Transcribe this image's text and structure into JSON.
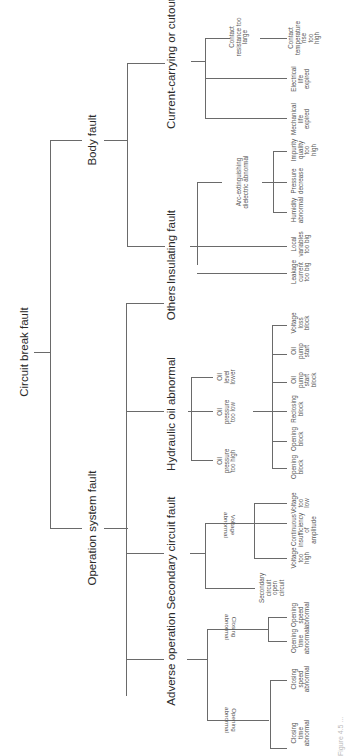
{
  "diagram": {
    "type": "fault-tree",
    "orientation": "rotated-90-ccw",
    "root": "Circuit break fault",
    "level1": [
      {
        "label": "Body fault",
        "children": [
          {
            "label": "Current-carrying or cutout fault",
            "children": [
              {
                "label": "Contact resistance too large",
                "children": [
                  {
                    "label": "Contact temperature rise too high"
                  }
                ]
              },
              {
                "label": "Electrical life expired"
              },
              {
                "label": "Mechanical life expired"
              }
            ]
          },
          {
            "label": "Insulating fault",
            "children": [
              {
                "label": "Arc-extinguishing dielectric abnormal",
                "children": [
                  {
                    "label": "Impurity quality too high"
                  },
                  {
                    "label": "Pressure decrease"
                  },
                  {
                    "label": "Humidity abnormal"
                  }
                ]
              },
              {
                "label": "Local variables too big"
              },
              {
                "label": "Leakage current too big"
              }
            ]
          }
        ]
      },
      {
        "label": "Operation system fault",
        "children": [
          {
            "label": "Others"
          },
          {
            "label": "Hydraulic oil abnormal",
            "children": [
              {
                "label": "Oil level lower"
              },
              {
                "label": "Oil pressure too low",
                "children": [
                  {
                    "label": "Voltage loss block"
                  },
                  {
                    "label": "Oil pump start"
                  },
                  {
                    "label": "Oil pump start block"
                  },
                  {
                    "label": "Reclosing block"
                  },
                  {
                    "label": "Opening block"
                  },
                  {
                    "label": "Opening block"
                  }
                ]
              },
              {
                "label": "Oil pressure too high"
              }
            ]
          },
          {
            "label": "Secondary circuit fault",
            "children": [
              {
                "label": "Voltage abnormal",
                "children": [
                  {
                    "label": "Voltage too low"
                  },
                  {
                    "label": "Continuous insufficiency of amplitude"
                  },
                  {
                    "label": "Voltage too high"
                  }
                ]
              },
              {
                "label": "Secondary circuit open circuit"
              }
            ]
          },
          {
            "label": "Adverse operation",
            "children": [
              {
                "label": "Closing abnormal",
                "children": [
                  {
                    "label": "Opening speed abnormal"
                  },
                  {
                    "label": "Opening time abnormal"
                  }
                ]
              },
              {
                "label": "Opening abnormal",
                "children": [
                  {
                    "label": "Closing speed abnormal"
                  },
                  {
                    "label": "Closing time abnormal"
                  }
                ]
              }
            ]
          }
        ]
      }
    ],
    "caption": "Figure 4.5 ..."
  },
  "labels": {
    "root": "Circuit break fault",
    "body": "Body fault",
    "operation": "Operation system fault",
    "current": "Current-carrying or cutout fault",
    "insulating": "Insulating fault",
    "others": "Others",
    "hydraulic": "Hydraulic oil abnormal",
    "secondary": "Secondary circuit fault",
    "adverse": "Adverse operation",
    "contact_res": [
      "Contact",
      "resistance too",
      "large"
    ],
    "contact_temp": [
      "Contact",
      "temperature",
      "rise",
      "too",
      "high"
    ],
    "elec_life": [
      "Electrical",
      "life",
      "expired"
    ],
    "mech_life": [
      "Mechanical",
      "life",
      "expired"
    ],
    "arc": [
      "Arc-extinguishing",
      "dielectric abnormal"
    ],
    "impurity": [
      "Impurity",
      "quality",
      "too",
      "high"
    ],
    "pressure_dec": [
      "Pressure",
      "decrease"
    ],
    "humidity": [
      "Humidity",
      "abnormal"
    ],
    "local_var": [
      "Local",
      "variables",
      "too big"
    ],
    "leakage": [
      "Leakage",
      "current",
      "too big"
    ],
    "voltage_loss": [
      "Voltage",
      "loss",
      "block"
    ],
    "oil_pump_start": [
      "Oil",
      "pump",
      "start"
    ],
    "oil_level": [
      "Oil",
      "level",
      "lower"
    ],
    "oil_pump_block": [
      "Oil",
      "pump",
      "start",
      "block"
    ],
    "oil_low": [
      "Oil",
      "pressure",
      "too low"
    ],
    "reclosing": [
      "Reclosing",
      "block"
    ],
    "opening_block1": [
      "Opening",
      "block"
    ],
    "opening_block2": [
      "Opening",
      "block"
    ],
    "oil_high": [
      "Oil",
      "pressure",
      "too high"
    ],
    "volt_low": [
      "Voltage",
      "too",
      "low"
    ],
    "volt_abn": [
      "Voltage",
      "abnormal"
    ],
    "continuous": [
      "Continuous",
      "insufficiency",
      "of",
      "amplitude"
    ],
    "volt_high": [
      "Voltage",
      "too",
      "high"
    ],
    "sec_open": [
      "Secondary",
      "circuit",
      "open",
      "circuit"
    ],
    "open_speed": [
      "Opening",
      "speed",
      "abnormal"
    ],
    "open_time": [
      "Opening",
      "time",
      "abnormal"
    ],
    "closing_abn": [
      "Closing",
      "abnormal"
    ],
    "close_speed": [
      "Closing",
      "speed",
      "abnormal"
    ],
    "close_time": [
      "Closing",
      "time",
      "abnormal"
    ],
    "opening_abn": [
      "Opening",
      "abnormal"
    ],
    "caption": "Figure 4.5 ..."
  }
}
